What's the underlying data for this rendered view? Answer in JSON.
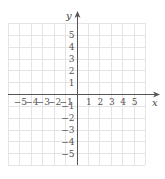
{
  "diagram": {
    "type": "coordinate-plane",
    "x_axis_label": "x",
    "y_axis_label": "y",
    "x_tick_labels": [
      "−5",
      "−4",
      "−3",
      "−2",
      "−1",
      "1",
      "2",
      "3",
      "4",
      "5"
    ],
    "y_tick_labels": [
      "5",
      "4",
      "3",
      "2",
      "1",
      "−1",
      "−2",
      "−3",
      "−4",
      "−5"
    ],
    "grid_range": {
      "x": [
        -6,
        6
      ],
      "y": [
        -6,
        6
      ]
    },
    "grid_color": "#e4e4e4",
    "axis_color": "#555555"
  }
}
